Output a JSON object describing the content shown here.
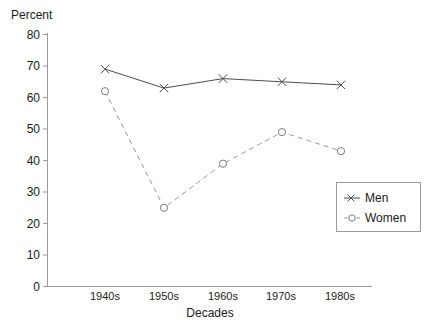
{
  "chart_data": {
    "type": "line",
    "title": "",
    "xlabel": "Decades",
    "ylabel": "Percent",
    "categories": [
      "1940s",
      "1950s",
      "1960s",
      "1970s",
      "1980s"
    ],
    "series": [
      {
        "name": "Men",
        "values": [
          69,
          63,
          66,
          65,
          64
        ],
        "marker": "x",
        "linestyle": "solid",
        "color": "#4d4d4d"
      },
      {
        "name": "Women",
        "values": [
          62,
          25,
          39,
          49,
          43
        ],
        "marker": "o",
        "linestyle": "dashed",
        "color": "#9a9a9a"
      }
    ],
    "ylim": [
      0,
      80
    ],
    "yticks": [
      0,
      10,
      20,
      30,
      40,
      50,
      60,
      70,
      80
    ],
    "ytick_labels": [
      "0",
      "10",
      "20",
      "30",
      "40",
      "50",
      "60",
      "70",
      "80"
    ],
    "grid": false,
    "legend_position": "center-right",
    "legend_entries": [
      "Men",
      "Women"
    ]
  },
  "axes": {
    "y_title": "Percent",
    "x_title": "Decades"
  },
  "legend": {
    "items": [
      {
        "label": "Men",
        "marker_icon": "cross-marker-icon"
      },
      {
        "label": "Women",
        "marker_icon": "circle-marker-icon"
      }
    ]
  }
}
